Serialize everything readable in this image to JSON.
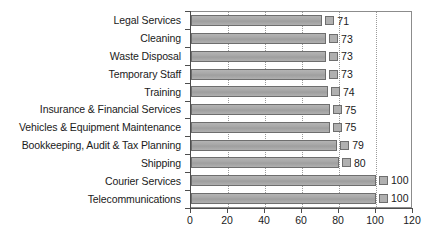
{
  "chart_data": {
    "type": "bar",
    "orientation": "horizontal",
    "title": "",
    "xlabel": "",
    "ylabel": "",
    "xlim": [
      0,
      120
    ],
    "xticks": [
      0,
      20,
      40,
      60,
      80,
      100,
      120
    ],
    "grid": true,
    "legend": false,
    "categories": [
      "Legal Services",
      "Cleaning",
      "Waste Disposal",
      "Temporary Staff",
      "Training",
      "Insurance & Financial Services",
      "Vehicles & Equipment Maintenance",
      "Bookkeeping, Audit & Tax Planning",
      "Shipping",
      "Courier Services",
      "Telecommunications"
    ],
    "values": [
      71,
      73,
      73,
      73,
      74,
      75,
      75,
      79,
      80,
      100,
      100
    ],
    "value_labels": [
      "71",
      "73",
      "73",
      "73",
      "74",
      "75",
      "75",
      "79",
      "80",
      "100",
      "100"
    ],
    "colors": {
      "bar_fill": "#a8a8a8",
      "bar_border": "#6e6e6e",
      "marker_fill": "#b0b0b0",
      "gridline": "#9a9a9a",
      "axis": "#4d4d4d",
      "plot_border": "#8c8c8c",
      "text": "#1a1a1a",
      "background": "#ffffff"
    }
  }
}
